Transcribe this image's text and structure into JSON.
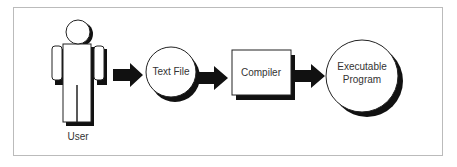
{
  "diagram": {
    "type": "flow",
    "nodes": [
      {
        "id": "user",
        "label": "User",
        "shape": "person"
      },
      {
        "id": "text_file",
        "label": "Text File",
        "shape": "circle"
      },
      {
        "id": "compiler",
        "label": "Compiler",
        "shape": "rectangle"
      },
      {
        "id": "executable",
        "label_line1": "Executable",
        "label_line2": "Program",
        "shape": "circle"
      }
    ],
    "edges": [
      {
        "from": "user",
        "to": "text_file"
      },
      {
        "from": "text_file",
        "to": "compiler"
      },
      {
        "from": "compiler",
        "to": "executable"
      }
    ]
  },
  "colors": {
    "fill": "#ffffff",
    "stroke": "#222222",
    "shadow": "#111111",
    "frame": "#bbbbbb",
    "text": "#333333"
  }
}
